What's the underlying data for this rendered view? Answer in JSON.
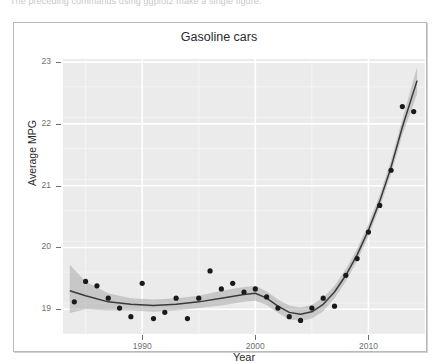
{
  "page": {
    "cutoff_text": "The preceding commands using ggplot2 make a single figure."
  },
  "chart_data": {
    "type": "scatter",
    "title": "Gasoline cars",
    "xlabel": "Year",
    "ylabel": "Average MPG",
    "xlim": [
      1983,
      2015
    ],
    "ylim": [
      18.6,
      23.05
    ],
    "xticks": [
      1990,
      2000,
      2010
    ],
    "xtick_labels": [
      "1990",
      "2000",
      "2010"
    ],
    "yticks": [
      19,
      20,
      21,
      22,
      23
    ],
    "ytick_labels": [
      "19",
      "20",
      "21",
      "22",
      "23"
    ],
    "grid": true,
    "grid_color": "#ffffff",
    "panel_background": "#ebebeb",
    "legend": "none",
    "point_color": "#1a1a1a",
    "line_color": "#3a3a3a",
    "band_color": "#9c9c9c",
    "band_opacity": 0.45,
    "series": [
      {
        "name": "Average MPG (observed)",
        "type": "scatter",
        "x": [
          1984,
          1985,
          1986,
          1987,
          1988,
          1989,
          1990,
          1991,
          1992,
          1993,
          1994,
          1995,
          1996,
          1997,
          1998,
          1999,
          2000,
          2001,
          2002,
          2003,
          2004,
          2005,
          2006,
          2007,
          2008,
          2009,
          2010,
          2011,
          2012,
          2013,
          2014
        ],
        "y": [
          19.12,
          19.45,
          19.38,
          19.18,
          19.02,
          18.88,
          19.42,
          18.85,
          18.95,
          19.18,
          18.85,
          19.18,
          19.62,
          19.33,
          19.42,
          19.28,
          19.33,
          19.2,
          19.02,
          18.88,
          18.82,
          19.02,
          19.18,
          19.05,
          19.55,
          19.82,
          20.25,
          20.68,
          21.25,
          22.28,
          22.2
        ]
      },
      {
        "name": "LOESS smooth fit",
        "type": "line",
        "x": [
          1983.6,
          1985,
          1987,
          1989,
          1991,
          1993,
          1995,
          1997,
          1999,
          2000,
          2001,
          2002,
          2003,
          2004,
          2005,
          2006,
          2007,
          2008,
          2009,
          2010,
          2011,
          2012,
          2013,
          2014.3
        ],
        "y": [
          19.3,
          19.22,
          19.12,
          19.08,
          19.06,
          19.08,
          19.12,
          19.18,
          19.24,
          19.26,
          19.18,
          19.05,
          18.95,
          18.92,
          18.96,
          19.08,
          19.28,
          19.55,
          19.88,
          20.28,
          20.75,
          21.3,
          21.95,
          22.7
        ]
      },
      {
        "name": "Confidence band (upper)",
        "type": "line",
        "x": [
          1983.6,
          1985,
          1987,
          1989,
          1991,
          1993,
          1995,
          1997,
          1999,
          2000,
          2001,
          2002,
          2003,
          2004,
          2005,
          2006,
          2007,
          2008,
          2009,
          2010,
          2011,
          2012,
          2013,
          2014.3
        ],
        "y": [
          19.72,
          19.45,
          19.26,
          19.18,
          19.16,
          19.18,
          19.22,
          19.3,
          19.36,
          19.38,
          19.29,
          19.16,
          19.06,
          19.03,
          19.07,
          19.19,
          19.38,
          19.65,
          19.98,
          20.38,
          20.85,
          21.41,
          22.08,
          22.92
        ]
      },
      {
        "name": "Confidence band (lower)",
        "type": "line",
        "x": [
          1983.6,
          1985,
          1987,
          1989,
          1991,
          1993,
          1995,
          1997,
          1999,
          2000,
          2001,
          2002,
          2003,
          2004,
          2005,
          2006,
          2007,
          2008,
          2009,
          2010,
          2011,
          2012,
          2013,
          2014.3
        ],
        "y": [
          18.94,
          19.0,
          18.98,
          18.98,
          18.96,
          18.98,
          19.02,
          19.06,
          19.12,
          19.14,
          19.07,
          18.94,
          18.84,
          18.81,
          18.85,
          18.97,
          19.18,
          19.45,
          19.78,
          20.18,
          20.65,
          21.19,
          21.82,
          22.48
        ]
      }
    ]
  }
}
